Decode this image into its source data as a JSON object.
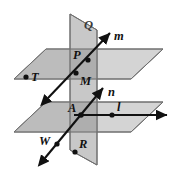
{
  "figure": {
    "kind": "geometry-diagram",
    "width": 174,
    "height": 171,
    "background_color": "#ffffff"
  },
  "colors": {
    "plane_light": "#d4d4d4",
    "plane_mid": "#c0c0c0",
    "plane_dark": "#a8a8a8",
    "plane_border": "#6f6f6f",
    "ink": "#111111",
    "label_gray": "#3a3a3a"
  },
  "planes": [
    {
      "id": "vertical-plane-q",
      "label": "Q",
      "label_x": 84,
      "label_y": 29,
      "shade": "#c0c0c0",
      "points": "70,14 97,30 97,165 70,150"
    },
    {
      "id": "upper-horizontal-plane",
      "label": "",
      "shade": "#d4d4d4",
      "points": "14,79 46,49 163,49 131,79"
    },
    {
      "id": "lower-horizontal-plane",
      "label": "",
      "shade": "#d4d4d4",
      "points": "14,132 46,102 163,102 131,132"
    }
  ],
  "lines": [
    {
      "id": "line-m",
      "label": "m",
      "label_x": 114,
      "label_y": 40,
      "x1": 48,
      "y1": 98,
      "x2": 110,
      "y2": 33,
      "arrow_start": true,
      "arrow_end": true
    },
    {
      "id": "line-n",
      "label": "n",
      "label_x": 108,
      "label_y": 96,
      "x1": 45,
      "y1": 158,
      "x2": 103,
      "y2": 88,
      "arrow_start": true,
      "arrow_end": true
    },
    {
      "id": "line-l",
      "label": "l",
      "label_x": 119,
      "label_y": 110,
      "x1": 74,
      "y1": 115,
      "x2": 169,
      "y2": 115,
      "arrow_start": false,
      "arrow_end": true
    }
  ],
  "points": [
    {
      "id": "point-t",
      "label": "T",
      "dot_x": 26,
      "dot_y": 77,
      "label_x": 31,
      "label_y": 81
    },
    {
      "id": "point-p",
      "label": "P",
      "dot_x": 88,
      "dot_y": 60,
      "label_x": 74,
      "label_y": 60
    },
    {
      "id": "point-m",
      "label": "M",
      "dot_x": 76,
      "dot_y": 73,
      "label_x": 80,
      "label_y": 84
    },
    {
      "id": "point-a",
      "label": "A",
      "dot_x": 81,
      "dot_y": 115,
      "label_x": 70,
      "label_y": 112
    },
    {
      "id": "point-i",
      "label": "l",
      "dot_x": 112,
      "dot_y": 115,
      "label_x": 117,
      "label_y": 111
    },
    {
      "id": "point-w",
      "label": "W",
      "dot_x": 57,
      "dot_y": 144,
      "label_x": 41,
      "label_y": 144
    },
    {
      "id": "point-r",
      "label": "R",
      "dot_x": 75,
      "dot_y": 152,
      "label_x": 79,
      "label_y": 147
    }
  ]
}
